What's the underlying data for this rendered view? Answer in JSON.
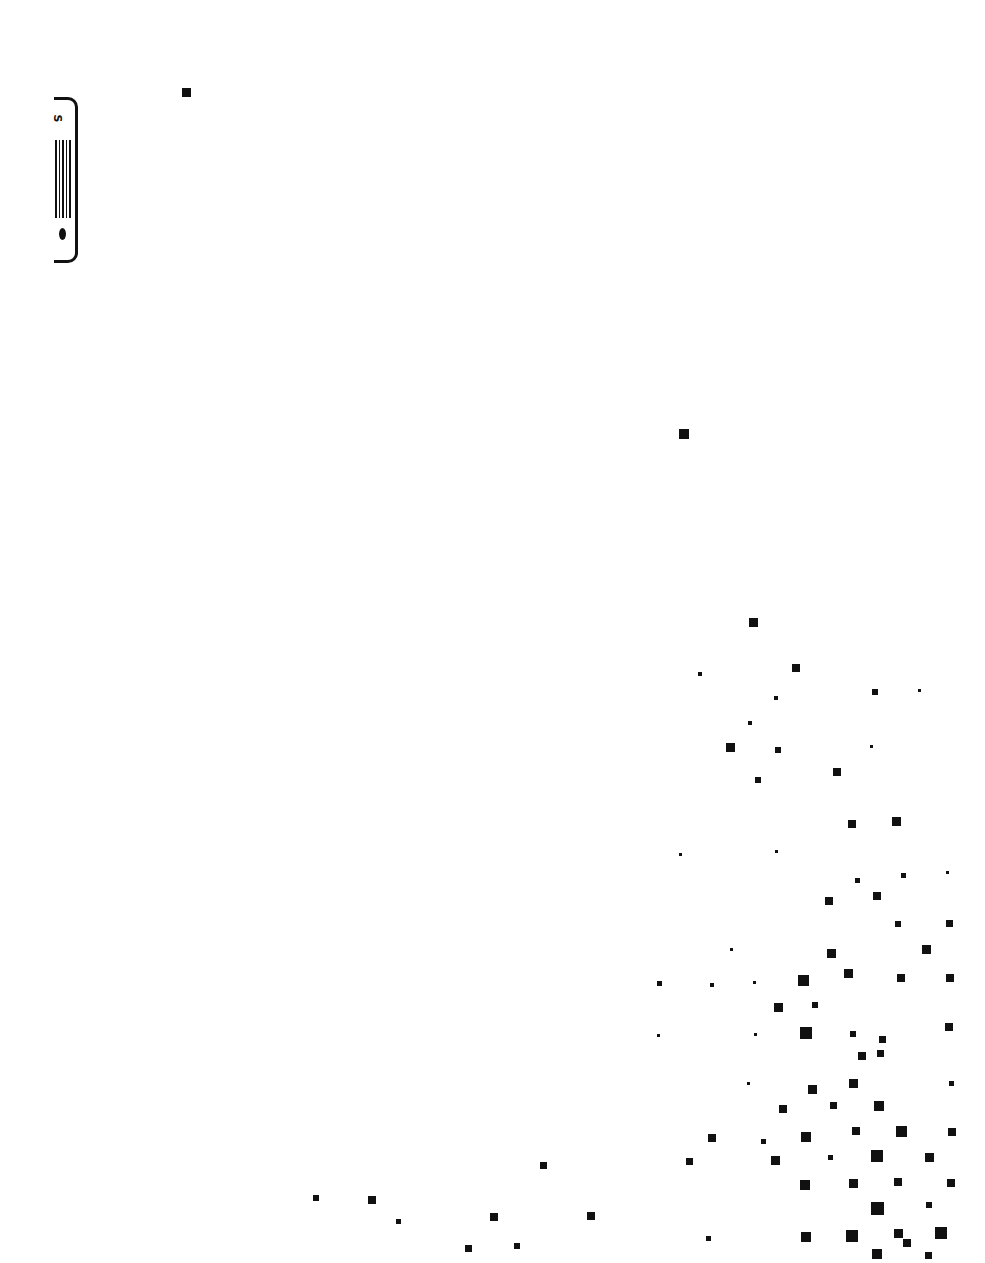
{
  "chart_data": {
    "type": "scatter",
    "title": "",
    "xlabel": "",
    "ylabel": "",
    "legend": {
      "symbol_label": "S",
      "position": "top-left, rotated"
    },
    "grid": false,
    "marker": "square",
    "marker_color": "#111111",
    "points_px": [
      [
        186,
        92,
        9
      ],
      [
        684,
        434,
        10
      ],
      [
        753,
        622,
        9
      ],
      [
        796,
        668,
        8
      ],
      [
        700,
        674,
        4
      ],
      [
        875,
        692,
        6
      ],
      [
        919,
        690,
        3
      ],
      [
        776,
        698,
        4
      ],
      [
        750,
        723,
        4
      ],
      [
        730,
        747,
        9
      ],
      [
        778,
        750,
        6
      ],
      [
        871,
        746,
        3
      ],
      [
        837,
        772,
        8
      ],
      [
        758,
        780,
        6
      ],
      [
        852,
        824,
        8
      ],
      [
        896,
        821,
        9
      ],
      [
        680,
        854,
        3
      ],
      [
        776,
        851,
        3
      ],
      [
        857,
        880,
        5
      ],
      [
        903,
        875,
        5
      ],
      [
        947,
        872,
        3
      ],
      [
        829,
        901,
        8
      ],
      [
        877,
        896,
        8
      ],
      [
        898,
        924,
        6
      ],
      [
        949,
        923,
        7
      ],
      [
        731,
        949,
        3
      ],
      [
        831,
        953,
        9
      ],
      [
        926,
        949,
        9
      ],
      [
        659,
        983,
        5
      ],
      [
        712,
        985,
        4
      ],
      [
        754,
        982,
        3
      ],
      [
        803,
        980,
        11
      ],
      [
        848,
        973,
        9
      ],
      [
        901,
        978,
        8
      ],
      [
        950,
        978,
        8
      ],
      [
        778,
        1007,
        9
      ],
      [
        815,
        1005,
        6
      ],
      [
        658,
        1035,
        3
      ],
      [
        755,
        1034,
        3
      ],
      [
        806,
        1033,
        12
      ],
      [
        853,
        1034,
        6
      ],
      [
        882,
        1039,
        7
      ],
      [
        949,
        1027,
        8
      ],
      [
        862,
        1056,
        8
      ],
      [
        880,
        1053,
        7
      ],
      [
        748,
        1083,
        3
      ],
      [
        812,
        1089,
        9
      ],
      [
        853,
        1083,
        9
      ],
      [
        951,
        1083,
        5
      ],
      [
        783,
        1109,
        8
      ],
      [
        833,
        1105,
        7
      ],
      [
        879,
        1106,
        10
      ],
      [
        712,
        1138,
        8
      ],
      [
        763,
        1141,
        5
      ],
      [
        806,
        1137,
        10
      ],
      [
        856,
        1131,
        8
      ],
      [
        901,
        1131,
        11
      ],
      [
        952,
        1132,
        8
      ],
      [
        689,
        1161,
        7
      ],
      [
        775,
        1160,
        9
      ],
      [
        830,
        1157,
        5
      ],
      [
        877,
        1156,
        12
      ],
      [
        929,
        1157,
        9
      ],
      [
        543,
        1165,
        7
      ],
      [
        805,
        1185,
        10
      ],
      [
        853,
        1183,
        9
      ],
      [
        898,
        1182,
        8
      ],
      [
        951,
        1183,
        8
      ],
      [
        316,
        1198,
        6
      ],
      [
        372,
        1200,
        8
      ],
      [
        398,
        1221,
        5
      ],
      [
        494,
        1217,
        8
      ],
      [
        591,
        1216,
        8
      ],
      [
        877,
        1208,
        13
      ],
      [
        929,
        1205,
        6
      ],
      [
        468,
        1248,
        7
      ],
      [
        517,
        1246,
        6
      ],
      [
        708,
        1238,
        5
      ],
      [
        806,
        1237,
        10
      ],
      [
        852,
        1236,
        12
      ],
      [
        898,
        1233,
        9
      ],
      [
        941,
        1233,
        12
      ],
      [
        907,
        1243,
        8
      ],
      [
        877,
        1254,
        10
      ],
      [
        928,
        1255,
        7
      ]
    ]
  }
}
